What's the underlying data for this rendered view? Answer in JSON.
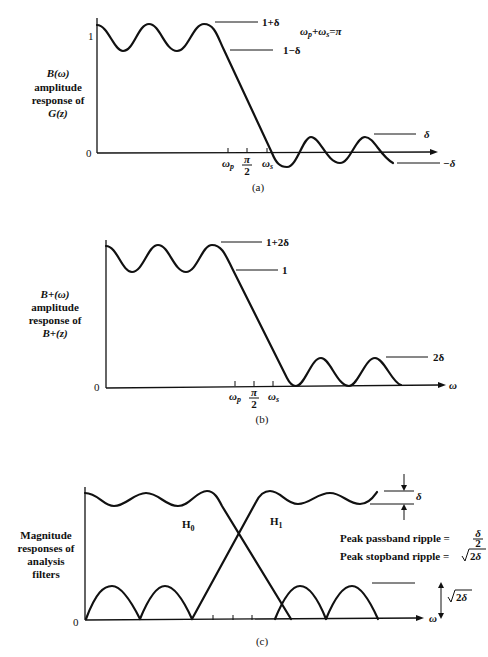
{
  "figure": {
    "panels": [
      {
        "id": "a",
        "caption": "(a)",
        "ylabel_lines": [
          "B(ω)",
          "amplitude",
          "response of",
          "G(z)"
        ],
        "y_ticks": [
          "1",
          "0"
        ],
        "x_ticks": [
          "ωp",
          "π/2",
          "ωs"
        ],
        "x_tick_pi": "π",
        "x_tick_2": "2",
        "x_tick_wp": "ωp",
        "x_tick_ws": "ωs",
        "level_labels": [
          "1+δ",
          "1−δ",
          "δ",
          "−δ"
        ],
        "annotation": "ωp+ωs=π"
      },
      {
        "id": "b",
        "caption": "(b)",
        "ylabel_lines": [
          "B+(ω)",
          "amplitude",
          "response of",
          "B+(z)"
        ],
        "y_ticks": [
          "0"
        ],
        "x_ticks": [
          "ωp",
          "π/2",
          "ωs"
        ],
        "x_tick_pi": "π",
        "x_tick_2": "2",
        "x_tick_wp": "ωp",
        "x_tick_ws": "ωs",
        "x_axis_label": "ω",
        "level_labels": [
          "1+2δ",
          "1",
          "2δ"
        ]
      },
      {
        "id": "c",
        "caption": "(c)",
        "ylabel_lines": [
          "Magnitude",
          "responses of",
          "analysis",
          "filters"
        ],
        "y_ticks": [
          "0"
        ],
        "x_axis_label": "ω",
        "curve_labels": [
          "H0",
          "H1"
        ],
        "h_sub": "0",
        "h1_sub": "1",
        "h_letter": "H",
        "delta_label": "δ",
        "sqrt_label": "√2δ",
        "notes": [
          "Peak passband ripple = δ/2",
          "Peak stopband ripple = √2δ"
        ],
        "note1_prefix": "Peak passband ripple =",
        "note1_num": "δ",
        "note1_den": "2",
        "note2_prefix": "Peak stopband ripple =",
        "note2_rad": "2δ"
      }
    ]
  }
}
